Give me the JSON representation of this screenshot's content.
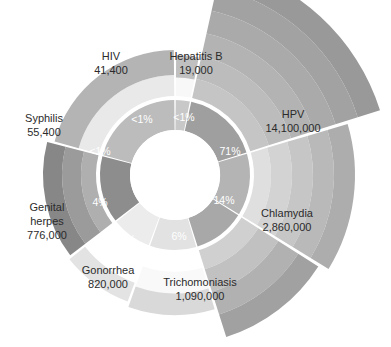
{
  "chart": {
    "type": "polar-area-donut",
    "title": "",
    "center": {
      "x": 175,
      "y": 175
    },
    "inner_hole_radius": 45,
    "inner_ring_outer_radius": 75,
    "colors": {
      "hpv": "#9f9f9f",
      "chlamydia": "#b4b4b4",
      "trichomoniasis": "#a8a8a8",
      "gonorrhea": "#e2e2e2",
      "genital_herpes": "#ececec",
      "syphilis": "#8d8d8d",
      "hiv": "#bcbcbc",
      "hepatitis_b": "#c8c8c8",
      "label_text": "#2b2b2b",
      "pct_text": "#ffffff",
      "background": "#ffffff"
    }
  },
  "chart_data": {
    "type": "pie",
    "title": "",
    "subtitle": "",
    "xlabel": "",
    "ylabel": "",
    "legend_position": "none",
    "grid": false,
    "categories": [
      "Hepatitis B",
      "HPV",
      "Chlamydia",
      "Trichomoniasis",
      "Gonorrhea",
      "Genital herpes",
      "Syphilis",
      "HIV"
    ],
    "values": [
      19000,
      14100000,
      2860000,
      1090000,
      820000,
      776000,
      55400,
      41400
    ],
    "value_labels": [
      "19,000",
      "14,100,000",
      "2,860,000",
      "1,090,000",
      "820,000",
      "776,000",
      "55,400",
      "41,400"
    ],
    "percent_labels": [
      "<1%",
      "71%",
      "14%",
      "6%",
      "4%",
      "4%",
      "<1%",
      "<1%"
    ],
    "percents": [
      0.1,
      71,
      14,
      6,
      4,
      4,
      0.3,
      0.2
    ]
  },
  "segments": [
    {
      "id": "hepatitis-b",
      "name": "Hepatitis B",
      "value_label": "19,000",
      "percent_label": "<1%",
      "start_angle": 0,
      "end_angle": 12,
      "band_radius": 120,
      "color": "#c8c8c8",
      "pct_color": "#ffffff",
      "label_x": 196,
      "label_y": 57,
      "value_x": 196,
      "value_y": 71,
      "pct_x": 184,
      "pct_y": 118
    },
    {
      "id": "hpv",
      "name": "HPV",
      "value_label": "14,100,000",
      "percent_label": "71%",
      "start_angle": 12,
      "end_angle": 73,
      "band_radius": 215,
      "color": "#9f9f9f",
      "pct_color": "#ffffff",
      "label_x": 293,
      "label_y": 115,
      "value_x": 293,
      "value_y": 129,
      "pct_x": 230,
      "pct_y": 152
    },
    {
      "id": "chlamydia",
      "name": "Chlamydia",
      "value_label": "2,860,000",
      "percent_label": "14%",
      "start_angle": 73,
      "end_angle": 122,
      "band_radius": 180,
      "color": "#b4b4b4",
      "pct_color": "#ffffff",
      "label_x": 287,
      "label_y": 214,
      "value_x": 287,
      "value_y": 228,
      "pct_x": 224,
      "pct_y": 201
    },
    {
      "id": "trichomoniasis",
      "name": "Trichomoniasis",
      "value_label": "1,090,000",
      "percent_label": "6%",
      "start_angle": 122,
      "end_angle": 163,
      "band_radius": 170,
      "color": "#a8a8a8",
      "pct_color": "#ffffff",
      "label_x": 200,
      "label_y": 283,
      "value_x": 200,
      "value_y": 297,
      "pct_x": 179,
      "pct_y": 237
    },
    {
      "id": "gonorrhea",
      "name": "Gonorrhea",
      "value_label": "820,000",
      "percent_label": "4%",
      "start_angle": 163,
      "end_angle": 200,
      "band_radius": 140,
      "color": "#e2e2e2",
      "pct_color": "#3a3a3a",
      "label_x": 108,
      "label_y": 271,
      "value_x": 108,
      "value_y": 285,
      "pct_x": 128,
      "pct_y": 240
    },
    {
      "id": "genital-herpes",
      "name": "Genital herpes",
      "value_label": "776,000",
      "percent_label": "4%",
      "start_angle": 200,
      "end_angle": 232,
      "band_radius": 135,
      "color": "#ececec",
      "pct_color": "#3a3a3a",
      "label_x": 47,
      "label_y": 208,
      "label_line2": "herpes",
      "value_x": 47,
      "value_y": 237,
      "pct_x": 100,
      "pct_y": 203
    },
    {
      "id": "syphilis",
      "name": "Syphilis",
      "value_label": "55,400",
      "percent_label": "<1%",
      "start_angle": 232,
      "end_angle": 285,
      "band_radius": 132,
      "color": "#8d8d8d",
      "pct_color": "#ffffff",
      "label_x": 44,
      "label_y": 119,
      "value_x": 44,
      "value_y": 133,
      "pct_x": 100,
      "pct_y": 152
    },
    {
      "id": "hiv",
      "name": "HIV",
      "value_label": "41,400",
      "percent_label": "<1%",
      "start_angle": 285,
      "end_angle": 360,
      "band_radius": 125,
      "color": "#bcbcbc",
      "pct_color": "#ffffff",
      "label_x": 111,
      "label_y": 57,
      "value_x": 111,
      "value_y": 71,
      "pct_x": 142,
      "pct_y": 120
    }
  ],
  "genital_herpes_extra": {
    "line1": "Genital",
    "line2": "herpes",
    "line3": "776,000"
  }
}
